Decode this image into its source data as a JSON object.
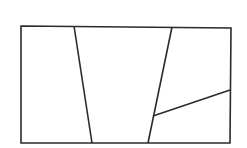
{
  "diagram": {
    "background": "#ffffff",
    "stroke_color": "#2b2b2b",
    "stroke_width": 1.6,
    "outer_rect": {
      "x1": 21,
      "y1": 26,
      "x2": 231,
      "y2": 143
    },
    "partition_lines": [
      {
        "id": "line-1",
        "x1": 74,
        "y1": 26,
        "x2": 92,
        "y2": 143
      },
      {
        "id": "line-2",
        "x1": 172,
        "y1": 27,
        "x2": 148,
        "y2": 143
      },
      {
        "id": "line-3",
        "x1": 153,
        "y1": 116,
        "x2": 230,
        "y2": 90
      }
    ],
    "region_count": 4
  }
}
